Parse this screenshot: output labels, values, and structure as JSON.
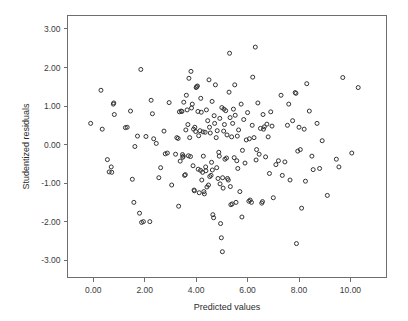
{
  "chart_data": {
    "type": "scatter",
    "title": "",
    "xlabel": "Predicted values",
    "ylabel": "Studentized residuals",
    "xlim": [
      -1.0,
      11.4
    ],
    "ylim": [
      -3.45,
      3.35
    ],
    "xticks": [
      0,
      2,
      4,
      6,
      8,
      10
    ],
    "xticklabels": [
      "0.00",
      "2.00",
      "4.00",
      "6.00",
      "8.00",
      "10.00"
    ],
    "yticks": [
      -3,
      -2,
      -1,
      0,
      1,
      2,
      3
    ],
    "yticklabels": [
      "-3.00",
      "-2.00",
      "-1.00",
      "0.00",
      "1.00",
      "2.00",
      "3.00"
    ],
    "grid": false,
    "legend": null,
    "marker": "open-circle",
    "marker_color": "#333333",
    "marker_size": 4,
    "n_points": 196,
    "points": [
      [
        -0.1,
        0.55
      ],
      [
        0.3,
        1.41
      ],
      [
        0.35,
        0.4
      ],
      [
        0.55,
        -0.39
      ],
      [
        0.62,
        -0.71
      ],
      [
        0.7,
        -0.58
      ],
      [
        0.72,
        -0.72
      ],
      [
        0.78,
        1.05
      ],
      [
        0.8,
        1.08
      ],
      [
        0.82,
        0.78
      ],
      [
        1.25,
        0.44
      ],
      [
        1.32,
        0.45
      ],
      [
        1.45,
        0.87
      ],
      [
        1.52,
        -0.9
      ],
      [
        1.58,
        -1.5
      ],
      [
        1.62,
        -0.05
      ],
      [
        1.72,
        0.22
      ],
      [
        1.8,
        -1.78
      ],
      [
        1.85,
        1.95
      ],
      [
        1.88,
        -2.02
      ],
      [
        1.95,
        -2.0
      ],
      [
        2.2,
        -2.0
      ],
      [
        2.25,
        1.15
      ],
      [
        2.3,
        0.8
      ],
      [
        2.35,
        0.15
      ],
      [
        2.45,
        0.03
      ],
      [
        2.55,
        -0.86
      ],
      [
        2.62,
        -0.6
      ],
      [
        2.75,
        0.35
      ],
      [
        2.8,
        -0.24
      ],
      [
        2.95,
        1.09
      ],
      [
        3.05,
        -1.05
      ],
      [
        3.2,
        -0.25
      ],
      [
        3.25,
        0.18
      ],
      [
        3.3,
        0.16
      ],
      [
        3.32,
        -1.6
      ],
      [
        3.38,
        -0.43
      ],
      [
        3.42,
        0.87
      ],
      [
        3.45,
        0.86
      ],
      [
        3.48,
        -0.33
      ],
      [
        3.5,
        -0.3
      ],
      [
        3.52,
        1.1
      ],
      [
        3.55,
        -0.8
      ],
      [
        3.58,
        -0.78
      ],
      [
        3.6,
        0.38
      ],
      [
        3.62,
        1.28
      ],
      [
        3.65,
        0.9
      ],
      [
        3.68,
        0.52
      ],
      [
        3.7,
        -0.29
      ],
      [
        3.72,
        1.72
      ],
      [
        3.75,
        0.18
      ],
      [
        3.78,
        -0.31
      ],
      [
        3.8,
        1.9
      ],
      [
        3.82,
        0.95
      ],
      [
        3.85,
        1.05
      ],
      [
        3.88,
        -0.55
      ],
      [
        3.9,
        0.4
      ],
      [
        3.92,
        -1.18
      ],
      [
        3.95,
        0.45
      ],
      [
        3.98,
        0.34
      ],
      [
        4.0,
        1.48
      ],
      [
        4.02,
        1.5
      ],
      [
        4.05,
        1.52
      ],
      [
        4.08,
        -0.64
      ],
      [
        4.1,
        0.23
      ],
      [
        4.12,
        -1.25
      ],
      [
        4.15,
        0.36
      ],
      [
        4.18,
        1.2
      ],
      [
        4.2,
        0.84
      ],
      [
        4.22,
        -0.92
      ],
      [
        4.25,
        -0.72
      ],
      [
        4.28,
        -0.3
      ],
      [
        4.3,
        -1.22
      ],
      [
        4.32,
        -1.28
      ],
      [
        4.35,
        0.32
      ],
      [
        4.38,
        -0.68
      ],
      [
        4.4,
        0.9
      ],
      [
        4.42,
        -1.1
      ],
      [
        4.45,
        0.62
      ],
      [
        4.48,
        -1.05
      ],
      [
        4.5,
        1.68
      ],
      [
        4.52,
        0.45
      ],
      [
        4.55,
        0.3
      ],
      [
        4.58,
        -0.8
      ],
      [
        4.6,
        -0.46
      ],
      [
        4.62,
        1.12
      ],
      [
        4.65,
        -1.82
      ],
      [
        4.68,
        -1.9
      ],
      [
        4.7,
        0.75
      ],
      [
        4.72,
        0.55
      ],
      [
        4.75,
        1.55
      ],
      [
        4.78,
        0.18
      ],
      [
        4.8,
        -0.6
      ],
      [
        4.82,
        0.36
      ],
      [
        4.85,
        -0.88
      ],
      [
        4.88,
        -0.2
      ],
      [
        4.9,
        -0.3
      ],
      [
        4.92,
        0.68
      ],
      [
        4.95,
        -2.05
      ],
      [
        4.98,
        -2.42
      ],
      [
        5.0,
        0.96
      ],
      [
        5.02,
        -2.78
      ],
      [
        5.05,
        -1.13
      ],
      [
        5.08,
        0.92
      ],
      [
        5.1,
        0.52
      ],
      [
        5.12,
        -0.38
      ],
      [
        5.15,
        0.88
      ],
      [
        5.18,
        -0.35
      ],
      [
        5.2,
        0.25
      ],
      [
        5.22,
        -0.88
      ],
      [
        5.25,
        -0.92
      ],
      [
        5.28,
        1.36
      ],
      [
        5.3,
        2.37
      ],
      [
        5.32,
        0.7
      ],
      [
        5.35,
        -1.56
      ],
      [
        5.38,
        0.2
      ],
      [
        5.4,
        -1.54
      ],
      [
        5.42,
        0.55
      ],
      [
        5.45,
        0.92
      ],
      [
        5.48,
        -0.34
      ],
      [
        5.5,
        1.55
      ],
      [
        5.55,
        -1.5
      ],
      [
        5.6,
        0.22
      ],
      [
        5.62,
        -0.62
      ],
      [
        5.65,
        0.38
      ],
      [
        5.7,
        -1.22
      ],
      [
        5.75,
        1.05
      ],
      [
        5.78,
        -1.88
      ],
      [
        5.8,
        -0.15
      ],
      [
        5.85,
        0.65
      ],
      [
        5.9,
        -0.48
      ],
      [
        5.95,
        0.12
      ],
      [
        6.0,
        0.83
      ],
      [
        6.05,
        -1.47
      ],
      [
        6.1,
        -1.44
      ],
      [
        6.15,
        -1.5
      ],
      [
        6.18,
        0.5
      ],
      [
        6.2,
        1.75
      ],
      [
        6.25,
        0.18
      ],
      [
        6.3,
        2.53
      ],
      [
        6.35,
        -0.13
      ],
      [
        6.4,
        1.08
      ],
      [
        6.45,
        -0.25
      ],
      [
        6.5,
        0.42
      ],
      [
        6.55,
        -1.52
      ],
      [
        6.58,
        -1.48
      ],
      [
        6.6,
        0.78
      ],
      [
        6.65,
        0.46
      ],
      [
        6.7,
        -0.32
      ],
      [
        6.75,
        0.53
      ],
      [
        6.8,
        0.2
      ],
      [
        6.85,
        -0.75
      ],
      [
        6.9,
        0.85
      ],
      [
        6.95,
        0.48
      ],
      [
        7.0,
        -1.38
      ],
      [
        7.1,
        -0.52
      ],
      [
        7.2,
        -0.42
      ],
      [
        7.3,
        1.28
      ],
      [
        7.35,
        -0.8
      ],
      [
        7.45,
        -0.45
      ],
      [
        7.55,
        0.5
      ],
      [
        7.6,
        1.05
      ],
      [
        7.65,
        -0.92
      ],
      [
        7.75,
        0.62
      ],
      [
        7.85,
        1.35
      ],
      [
        7.88,
        1.33
      ],
      [
        7.9,
        -2.57
      ],
      [
        7.95,
        -0.17
      ],
      [
        8.0,
        0.45
      ],
      [
        8.05,
        -0.13
      ],
      [
        8.1,
        -1.65
      ],
      [
        8.2,
        0.4
      ],
      [
        8.25,
        -0.95
      ],
      [
        8.3,
        1.58
      ],
      [
        8.4,
        0.87
      ],
      [
        8.5,
        -0.3
      ],
      [
        8.55,
        -0.65
      ],
      [
        8.7,
        0.55
      ],
      [
        8.8,
        -0.62
      ],
      [
        8.9,
        0.1
      ],
      [
        9.1,
        -1.32
      ],
      [
        9.45,
        -0.38
      ],
      [
        9.55,
        -0.58
      ],
      [
        9.7,
        1.74
      ],
      [
        10.05,
        -0.22
      ],
      [
        10.3,
        1.48
      ],
      [
        2.05,
        0.21
      ],
      [
        3.35,
        0.85
      ],
      [
        4.07,
        0.86
      ],
      [
        4.27,
        0.33
      ],
      [
        5.07,
        0.35
      ],
      [
        5.52,
        0.76
      ],
      [
        6.07,
        0.15
      ],
      [
        6.62,
        0.4
      ],
      [
        3.47,
        -0.26
      ],
      [
        4.37,
        -0.58
      ],
      [
        4.63,
        -0.66
      ],
      [
        5.03,
        -0.86
      ],
      [
        5.58,
        -0.42
      ],
      [
        2.88,
        -0.22
      ],
      [
        4.17,
        -0.67
      ],
      [
        4.93,
        -1.02
      ],
      [
        5.33,
        -1.09
      ],
      [
        3.93,
        -1.2
      ],
      [
        4.53,
        -0.83
      ],
      [
        6.33,
        -0.4
      ]
    ]
  },
  "axes": {
    "x_axis_label": "Predicted values",
    "y_axis_label": "Studentized residuals"
  }
}
